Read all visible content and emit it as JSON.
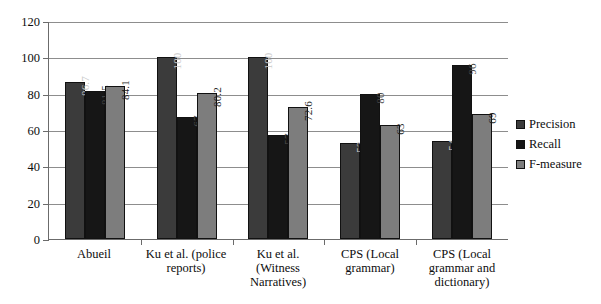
{
  "chart_data": {
    "type": "bar",
    "title": "",
    "xlabel": "",
    "ylabel": "",
    "ylim": [
      0,
      120
    ],
    "yticks": [
      0,
      20,
      40,
      60,
      80,
      100,
      120
    ],
    "grid": true,
    "legend_position": "right",
    "categories": [
      "Abueil",
      "Ku et al. (police reports)",
      "Ku et al. (Witness Narratives)",
      "CPS (Local grammar)",
      "CPS (Local grammar and dictionary)"
    ],
    "series": [
      {
        "name": "Precision",
        "color": "#3b3b3b",
        "values": [
          86.7,
          100,
          100,
          53,
          54
        ],
        "labels": [
          "86.7",
          "100",
          "100",
          "53",
          "54"
        ]
      },
      {
        "name": "Recall",
        "color": "#161616",
        "values": [
          81.5,
          67,
          57,
          80,
          96
        ],
        "labels": [
          "81.5",
          "67",
          "57",
          "80",
          "96"
        ]
      },
      {
        "name": "F-measure",
        "color": "#7d7d7d",
        "values": [
          84.1,
          80.2,
          72.6,
          63,
          69
        ],
        "labels": [
          "84.1",
          "80.2",
          "72.6",
          "63",
          "69"
        ]
      }
    ]
  }
}
